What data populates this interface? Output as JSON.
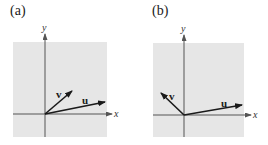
{
  "figure": {
    "panels": [
      {
        "id": "a",
        "label": "(a)",
        "x_axis_label": "x",
        "y_axis_label": "y",
        "vectors": [
          {
            "name": "u",
            "label": "u",
            "description": "long vector pointing right, slightly upward"
          },
          {
            "name": "v",
            "label": "v",
            "description": "shorter vector pointing up and to the right (~40° from x-axis)"
          }
        ]
      },
      {
        "id": "b",
        "label": "(b)",
        "x_axis_label": "x",
        "y_axis_label": "y",
        "vectors": [
          {
            "name": "u",
            "label": "u",
            "description": "long vector pointing right, slightly upward"
          },
          {
            "name": "v",
            "label": "v",
            "description": "vector pointing up and to the left (second quadrant)"
          }
        ]
      }
    ],
    "colors": {
      "background_box": "#e6e6e6",
      "axes": "#555555",
      "vectors": "#1a1a1a"
    }
  }
}
